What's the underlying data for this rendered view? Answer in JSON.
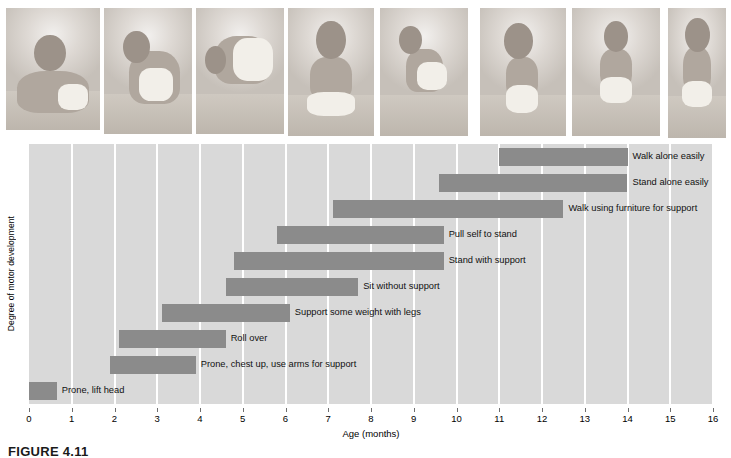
{
  "figure": {
    "caption_label": "FIGURE",
    "caption_number": "4.11"
  },
  "photo_strip": {
    "photos": [
      {
        "name": "baby-prone-lifting-head",
        "alt": "Infant lying prone lifting head"
      },
      {
        "name": "baby-rolling-over",
        "alt": "Infant rolling over"
      },
      {
        "name": "baby-crawling-on-hands-and-feet",
        "alt": "Infant supporting weight on hands and feet"
      },
      {
        "name": "baby-sitting-without-support",
        "alt": "Infant sitting without support"
      },
      {
        "name": "baby-pulling-self-to-stand",
        "alt": "Infant pulling self up to stand at a box"
      },
      {
        "name": "baby-standing-with-support",
        "alt": "Infant standing holding furniture"
      },
      {
        "name": "baby-walking-with-help",
        "alt": "Toddler walking with adult support"
      },
      {
        "name": "baby-walking-alone",
        "alt": "Toddler walking alone"
      }
    ]
  },
  "chart_data": {
    "type": "bar",
    "orientation": "horizontal-range",
    "title": "",
    "xlabel": "Age (months)",
    "ylabel": "Degree of motor development",
    "xlim": [
      0,
      16
    ],
    "xticks": [
      0,
      1,
      2,
      3,
      4,
      5,
      6,
      7,
      8,
      9,
      10,
      11,
      12,
      13,
      14,
      15,
      16
    ],
    "xtick_labels": [
      "0",
      "1",
      "2",
      "3",
      "4",
      "5",
      "6",
      "7",
      "8",
      "9",
      "10",
      "11",
      "12",
      "13",
      "14",
      "15",
      "16"
    ],
    "grid": true,
    "legend": "none",
    "bar_color": "#8b8b8b",
    "plot_background": "#d9d9d9",
    "gridline_color": "#ffffff",
    "categories": [
      "Walk alone easily",
      "Stand alone easily",
      "Walk using furniture for support",
      "Pull self to stand",
      "Stand with support",
      "Sit without support",
      "Support some weight with legs",
      "Roll over",
      "Prone, chest up, use arms for support",
      "Prone, lift head"
    ],
    "ranges": [
      {
        "milestone": "Walk alone easily",
        "start": 11.0,
        "end": 14.0,
        "label_side": "right"
      },
      {
        "milestone": "Stand alone easily",
        "start": 9.6,
        "end": 14.0,
        "label_side": "right"
      },
      {
        "milestone": "Walk using furniture for support",
        "start": 7.1,
        "end": 12.5,
        "label_side": "right"
      },
      {
        "milestone": "Pull self to stand",
        "start": 5.8,
        "end": 9.7,
        "label_side": "right"
      },
      {
        "milestone": "Stand with support",
        "start": 4.8,
        "end": 9.7,
        "label_side": "right"
      },
      {
        "milestone": "Sit without support",
        "start": 4.6,
        "end": 7.7,
        "label_side": "right"
      },
      {
        "milestone": "Support some weight with legs",
        "start": 3.1,
        "end": 6.1,
        "label_side": "right"
      },
      {
        "milestone": "Roll over",
        "start": 2.1,
        "end": 4.6,
        "label_side": "right"
      },
      {
        "milestone": "Prone, chest up, use arms for support",
        "start": 1.9,
        "end": 3.9,
        "label_side": "right"
      },
      {
        "milestone": "Prone, lift head",
        "start": 0.0,
        "end": 0.65,
        "label_side": "right"
      }
    ]
  }
}
